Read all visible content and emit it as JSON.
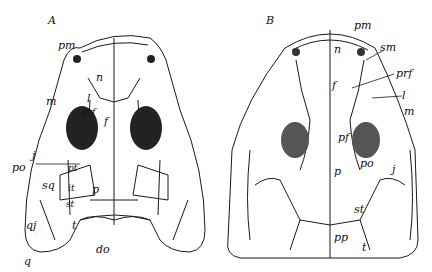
{
  "figure": {
    "panels": [
      {
        "id": "A",
        "label": "A",
        "bone_labels": {
          "pm": "pm",
          "n": "n",
          "m": "m",
          "l": "l",
          "prf": "prf",
          "f": "f",
          "j": "j",
          "po": "po",
          "pt": "pt",
          "sq": "sq",
          "it": "it",
          "p": "p",
          "st": "st",
          "qj": "qj",
          "t": "t",
          "do": "do",
          "q": "q"
        }
      },
      {
        "id": "B",
        "label": "B",
        "bone_labels": {
          "pm": "pm",
          "sm": "sm",
          "n": "n",
          "prf": "prf",
          "l": "l",
          "m": "m",
          "f": "f",
          "pf": "pf",
          "po": "po",
          "j": "j",
          "p": "p",
          "st": "st",
          "pp": "pp",
          "t": "t"
        }
      }
    ],
    "colors": {
      "ink": "#1a1a1a",
      "orbit_fill": "#222222",
      "background": "#ffffff"
    }
  }
}
